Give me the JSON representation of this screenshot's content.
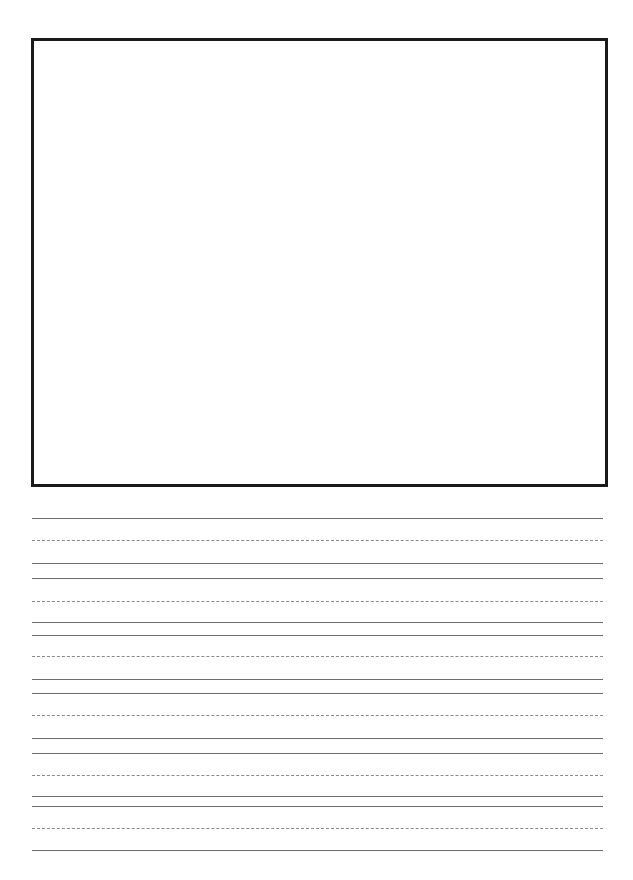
{
  "page": {
    "kind": "handwriting-practice-worksheet",
    "title": "",
    "width": 633,
    "height": 880,
    "background_color": "#ffffff"
  },
  "drawing_box": {
    "label": "",
    "x": 31,
    "y": 38,
    "width": 577,
    "height": 449,
    "border_color": "#1a1a1a",
    "border_width": 3,
    "fill_color": "#ffffff"
  },
  "writing_area": {
    "left": 32,
    "right": 603,
    "line_color_solid": "#6e6e6e",
    "line_color_dashed": "#8a8a8a",
    "solid_width": 1,
    "dashed_width": 1,
    "dash_pattern": "4 3",
    "rows": [
      {
        "index": 1,
        "top_line_y": 518,
        "mid_line_y": 540,
        "base_line_y": 563,
        "left": 32,
        "right": 603
      },
      {
        "index": 2,
        "top_line_y": 578,
        "mid_line_y": 601,
        "base_line_y": 622,
        "left": 32,
        "right": 603
      },
      {
        "index": 3,
        "top_line_y": 635,
        "mid_line_y": 656,
        "base_line_y": 679,
        "left": 32,
        "right": 603
      },
      {
        "index": 4,
        "top_line_y": 693,
        "mid_line_y": 715,
        "base_line_y": 738,
        "left": 32,
        "right": 603
      },
      {
        "index": 5,
        "top_line_y": 753,
        "mid_line_y": 775,
        "base_line_y": 796,
        "left": 32,
        "right": 603
      },
      {
        "index": 6,
        "top_line_y": 806,
        "mid_line_y": 828,
        "base_line_y": 850,
        "left": 32,
        "right": 603
      }
    ]
  }
}
